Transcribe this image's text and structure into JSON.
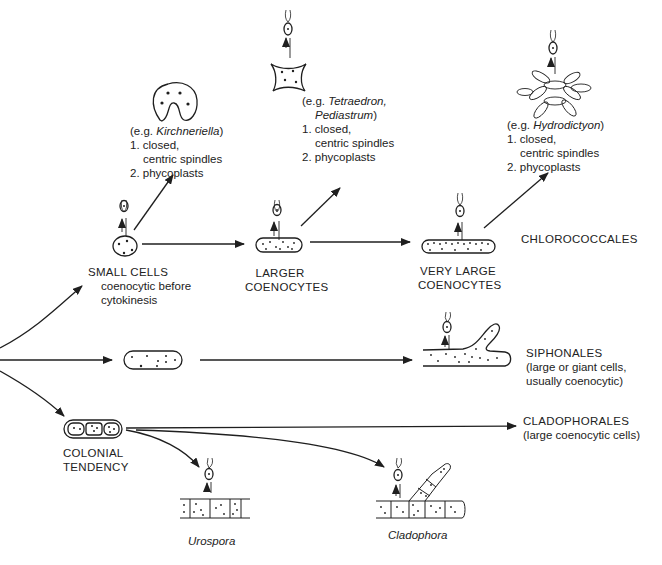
{
  "diagram": {
    "colors": {
      "ink": "#1f1f1f",
      "background": "#ffffff",
      "text": "#222222"
    },
    "examples": [
      {
        "id": "kirchneriella",
        "prefix": "(e.g. ",
        "genus": "Kirchneriella",
        "suffix": ")",
        "points": [
          "1. closed,",
          "centric spindles",
          "2. phycoplasts"
        ]
      },
      {
        "id": "tetraedron",
        "prefix": "(e.g. ",
        "genus": "Tetraedron,",
        "genus2": "Pediastrum",
        "suffix": ")",
        "points": [
          "1. closed,",
          "centric spindles",
          "2. phycoplasts"
        ]
      },
      {
        "id": "hydrodictyon",
        "prefix": "(e.g. ",
        "genus": "Hydrodictyon",
        "suffix": ")",
        "points": [
          "1. closed,",
          "centric spindles",
          "2. phycoplasts"
        ]
      }
    ],
    "stages": {
      "small_cells": {
        "title": "SMALL CELLS",
        "desc1": "coenocytic before",
        "desc2": "cytokinesis"
      },
      "larger_coenocytes": {
        "line1": "LARGER",
        "line2": "COENOCYTES"
      },
      "very_large_coenocytes": {
        "line1": "VERY LARGE",
        "line2": "COENOCYTES"
      },
      "colonial": {
        "line1": "COLONIAL",
        "line2": "TENDENCY"
      }
    },
    "orders": {
      "chlorococcales": {
        "name": "CHLOROCOCCALES"
      },
      "siphonales": {
        "name": "SIPHONALES",
        "desc1": "(large or giant cells,",
        "desc2": "usually coenocytic)"
      },
      "cladophorales": {
        "name": "CLADOPHORALES",
        "desc1": "(large coenocytic cells)"
      }
    },
    "genera": {
      "urospora": "Urospora",
      "cladophora": "Cladophora"
    }
  }
}
